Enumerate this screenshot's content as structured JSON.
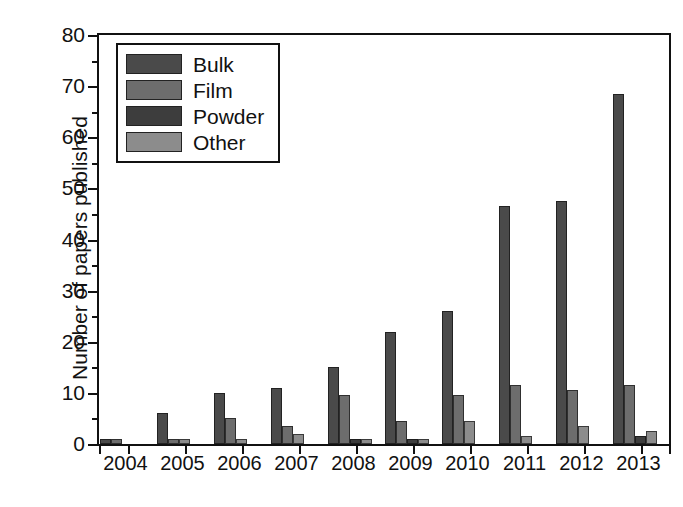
{
  "chart_data": {
    "type": "bar",
    "title": "",
    "subtitle": "",
    "xlabel": "",
    "ylabel": "Number of papers published",
    "categories": [
      "2004",
      "2005",
      "2006",
      "2007",
      "2008",
      "2009",
      "2010",
      "2011",
      "2012",
      "2013"
    ],
    "series": [
      {
        "name": "Bulk",
        "color": "#4a4a4a",
        "values": [
          1,
          6,
          10,
          11,
          15,
          22,
          26,
          46.5,
          47.5,
          68.5
        ]
      },
      {
        "name": "Film",
        "color": "#6d6d6d",
        "values": [
          1,
          1,
          5,
          3.5,
          9.5,
          4.5,
          9.5,
          11.5,
          10.5,
          11.5
        ]
      },
      {
        "name": "Powder",
        "color": "#3d3d3d",
        "values": [
          0,
          0,
          0,
          0,
          1,
          1,
          0,
          0,
          0,
          1.5
        ]
      },
      {
        "name": "Other",
        "color": "#8c8c8c",
        "values": [
          0,
          1,
          1,
          2,
          1,
          1,
          4.5,
          1.5,
          3.5,
          2.5
        ]
      }
    ],
    "ylim": [
      0,
      80
    ],
    "yticks": [
      0,
      10,
      20,
      30,
      40,
      50,
      60,
      70,
      80
    ],
    "yticklabels": [
      "0",
      "10",
      "20",
      "30",
      "40",
      "50",
      "60",
      "70",
      "80"
    ],
    "yminorticks": [
      5,
      15,
      25,
      35,
      45,
      55,
      65,
      75
    ],
    "grid": false,
    "legend_position": "upper-left",
    "legend_entries": [
      "Bulk",
      "Film",
      "Powder",
      "Other"
    ]
  }
}
